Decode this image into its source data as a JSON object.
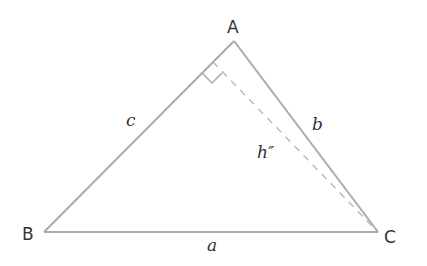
{
  "diagram": {
    "type": "triangle-with-altitude",
    "vertices": {
      "A": {
        "label": "A",
        "x": 234,
        "y": 41
      },
      "B": {
        "label": "B",
        "x": 44,
        "y": 232
      },
      "C": {
        "label": "C",
        "x": 378,
        "y": 232
      }
    },
    "sides": {
      "a": {
        "label": "a",
        "between": "B-C"
      },
      "b": {
        "label": "b",
        "between": "A-C"
      },
      "c": {
        "label": "c",
        "between": "A-B"
      }
    },
    "altitude": {
      "label": "h″",
      "from": "C",
      "foot_on": "AB",
      "style": "dashed"
    },
    "right_angle_marker": true,
    "colors": {
      "stroke": "#aaaaaa",
      "dashed": "#bbbbbb",
      "text": "#333333"
    }
  }
}
